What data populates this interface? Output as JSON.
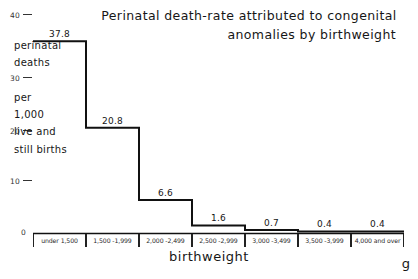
{
  "chart_data": {
    "type": "bar",
    "title": "Perinatal death-rate attributed to congenital anomalies by birthweight",
    "title_line1": "Perinatal death-rate attributed to congenital",
    "title_line2": "anomalies by birthweight",
    "xlabel": "birthweight",
    "xunit": "g",
    "ylabel": "perinatal deaths per 1,000 live and still births",
    "ylabel_lines": [
      "perinatal",
      "deaths",
      "per",
      "1,000",
      "live and",
      "still births"
    ],
    "categories": [
      "under  1,500",
      "1,500 -1,999",
      "2,000 -2,499",
      "2,500 -2,999",
      "3,000 -3,499",
      "3,500 -3,999",
      "4,000 and  over"
    ],
    "values": [
      37.8,
      20.8,
      6.6,
      1.6,
      0.7,
      0.4,
      0.4
    ],
    "value_labels": [
      "37.8",
      "20.8",
      "6.6",
      "1.6",
      "0.7",
      "0.4",
      "0.4"
    ],
    "yticks": [
      0,
      10,
      20,
      30,
      40
    ],
    "ytick_labels": [
      "0",
      "10",
      "20",
      "30",
      "40"
    ],
    "ylim": [
      0,
      40
    ],
    "grid": false,
    "legend": "none",
    "line_color": "#111111"
  }
}
